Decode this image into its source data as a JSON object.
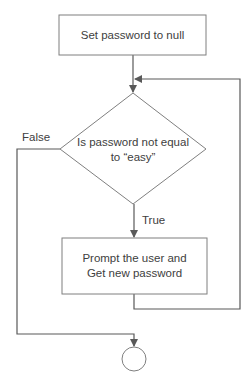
{
  "diagram": {
    "type": "flowchart",
    "nodes": [
      {
        "id": "init",
        "shape": "process",
        "lines": [
          "Set password to null"
        ]
      },
      {
        "id": "check",
        "shape": "decision",
        "lines": [
          "Is password not equal",
          "to “easy”"
        ]
      },
      {
        "id": "prompt",
        "shape": "process",
        "lines": [
          "Prompt the user and",
          "Get new password"
        ]
      },
      {
        "id": "end",
        "shape": "terminator-circle",
        "lines": []
      }
    ],
    "edges": [
      {
        "from": "init",
        "to": "check",
        "label": ""
      },
      {
        "from": "check",
        "to": "prompt",
        "label": "True"
      },
      {
        "from": "prompt",
        "to": "check",
        "label": ""
      },
      {
        "from": "check",
        "to": "end",
        "label": "False"
      }
    ]
  }
}
